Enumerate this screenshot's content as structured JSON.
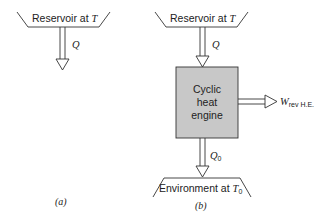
{
  "figure_a": {
    "reservoir_label": "Reservoir at ",
    "reservoir_symbol": "T",
    "heat_label": "Q",
    "caption": "(a)"
  },
  "figure_b": {
    "reservoir_label": "Reservoir at ",
    "reservoir_symbol": "T",
    "heat_in_label": "Q",
    "engine_lines": [
      "Cyclic",
      "heat",
      "engine"
    ],
    "heat_out_label": "Q",
    "heat_out_subscript": "0",
    "work_label": "W",
    "work_subscript": "rev H.E.",
    "environment_label": "Environment at ",
    "environment_symbol": "T",
    "environment_subscript": "0",
    "caption": "(b)"
  },
  "colors": {
    "line": "#333333",
    "engine_fill": "#c8c8c8"
  }
}
